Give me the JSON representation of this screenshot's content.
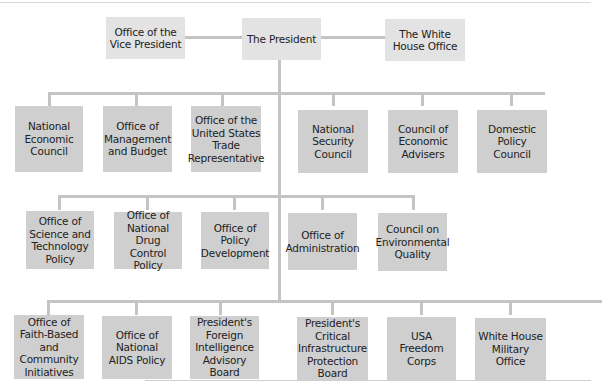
{
  "chart": {
    "top_row": {
      "vice_president": "Office of the Vice President",
      "president": "The President",
      "white_house_office": "The White House Office"
    },
    "row1": [
      {
        "label": "National Economic Council"
      },
      {
        "label": "Office of Management and Budget"
      },
      {
        "label": "Office of the United States Trade Representative"
      },
      {
        "label": "National Security Council"
      },
      {
        "label": "Council of Economic Advisers"
      },
      {
        "label": "Domestic Policy Council"
      }
    ],
    "row2": [
      {
        "label": "Office of Science and Technology Policy"
      },
      {
        "label": "Office of National Drug Control Policy"
      },
      {
        "label": "Office of Policy Development"
      },
      {
        "label": "Office of Administration"
      },
      {
        "label": "Council on Environmental Quality"
      }
    ],
    "row3": [
      {
        "label": "Office of Faith-Based and Community Initiatives"
      },
      {
        "label": "Office of National AIDS Policy"
      },
      {
        "label": "President's Foreign Intelligence Advisory Board"
      },
      {
        "label": "President's Critical Infrastructure Protection Board"
      },
      {
        "label": "USA Freedom Corps"
      },
      {
        "label": "White House Military Office"
      }
    ]
  },
  "colors": {
    "top_box": "#e3e3e3",
    "sub_box": "#cfcfcf",
    "connector": "#c4c4c4"
  }
}
